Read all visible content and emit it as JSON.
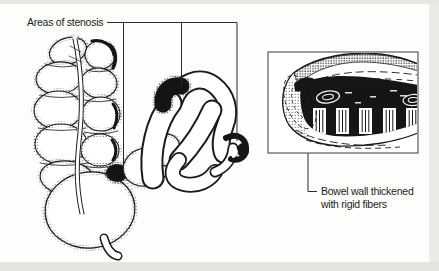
{
  "figure": {
    "type": "medical-line-illustration",
    "labels": {
      "areas_of_stenosis": "Areas of stenosis",
      "bowel_wall_line1": "Bowel wall thickened",
      "bowel_wall_line2": "with rigid fibers"
    },
    "parts": {
      "colon": "large-intestine-with-haustra",
      "loop": "narrowed-bowel-loop",
      "inset": "bowel-wall-cross-section"
    },
    "colors": {
      "ink": "#1a1a1a",
      "paper": "#fdfdfc",
      "page_edge": "#e7e5e1"
    }
  }
}
